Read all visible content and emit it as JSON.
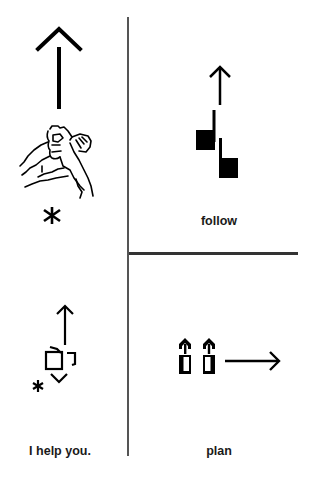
{
  "panels": [
    {
      "id": "top-left",
      "symbol": "signwriting-help-sign",
      "label": "",
      "icons": [
        "up-arrow-icon",
        "hand-drawing-icon",
        "asterisk-icon"
      ]
    },
    {
      "id": "top-right",
      "symbol": "signwriting-follow",
      "label": "follow",
      "icons": [
        "up-arrow-icon",
        "hand-shape-icon",
        "hand-shape-icon"
      ]
    },
    {
      "id": "bottom-left",
      "symbol": "signwriting-i-help-you",
      "label": "I help you.",
      "icons": [
        "up-arrow-icon",
        "hand-shape-icon",
        "asterisk-icon"
      ]
    },
    {
      "id": "bottom-right",
      "symbol": "signwriting-plan",
      "label": "plan",
      "icons": [
        "hand-shape-icon",
        "hand-shape-icon",
        "right-arrow-icon"
      ]
    }
  ],
  "colors": {
    "ink": "#000000",
    "divider": "#444444",
    "background": "#ffffff"
  }
}
